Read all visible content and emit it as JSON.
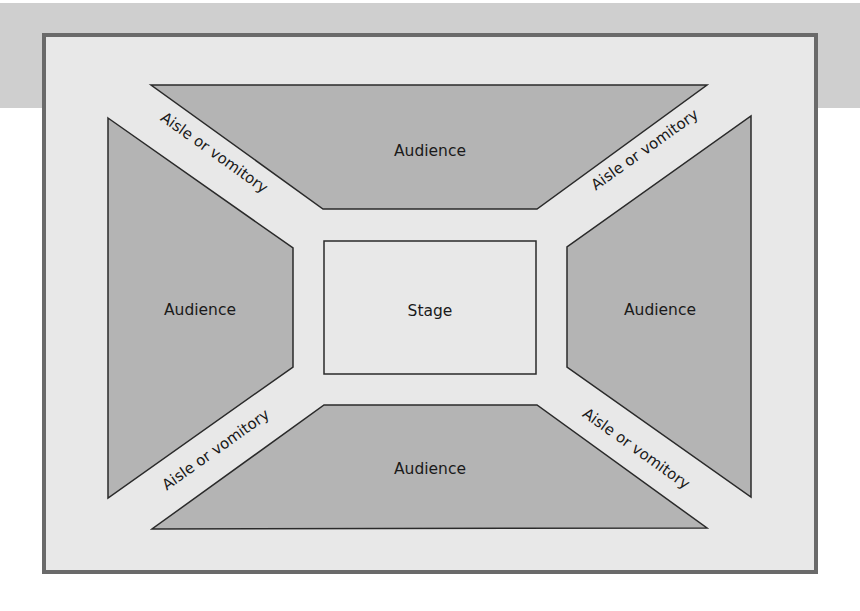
{
  "diagram": {
    "type": "thrust/arena stage floor plan",
    "colors": {
      "band": "#cfcfcf",
      "frame_bg": "#e8e8e8",
      "frame_border": "#6a6a6a",
      "audience_fill": "#b4b4b4",
      "outline": "#2a2a2a"
    },
    "stage": {
      "label": "Stage"
    },
    "audience": {
      "top": {
        "label": "Audience"
      },
      "left": {
        "label": "Audience"
      },
      "right": {
        "label": "Audience"
      },
      "bottom": {
        "label": "Audience"
      }
    },
    "aisles": {
      "top_left": {
        "label": "Aisle or vomitory"
      },
      "top_right": {
        "label": "Aisle or vomitory"
      },
      "bottom_left": {
        "label": "Aisle or vomitory"
      },
      "bottom_right": {
        "label": "Aisle or vomitory"
      }
    }
  }
}
